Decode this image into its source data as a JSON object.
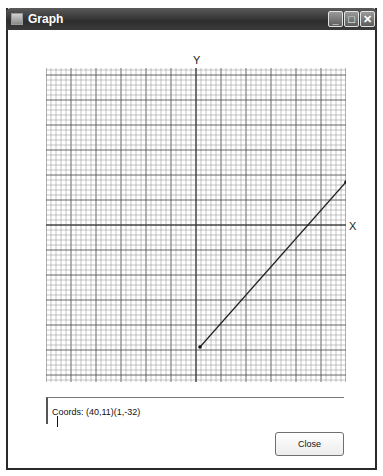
{
  "window": {
    "title": "Graph",
    "controls": {
      "minimize": "_",
      "maximize": "□",
      "close": "✕"
    }
  },
  "graph": {
    "y_axis_label": "Y",
    "x_axis_label": "X",
    "grid_color": "#8a8a8a",
    "major_grid_color": "#555555",
    "line_color": "#222222",
    "segment": {
      "x1": 200,
      "y1": 347,
      "x2": 346,
      "y2": 182
    }
  },
  "coords": {
    "text": "Coords: (40,11)(1,-32)"
  },
  "buttons": {
    "close": "Close"
  }
}
